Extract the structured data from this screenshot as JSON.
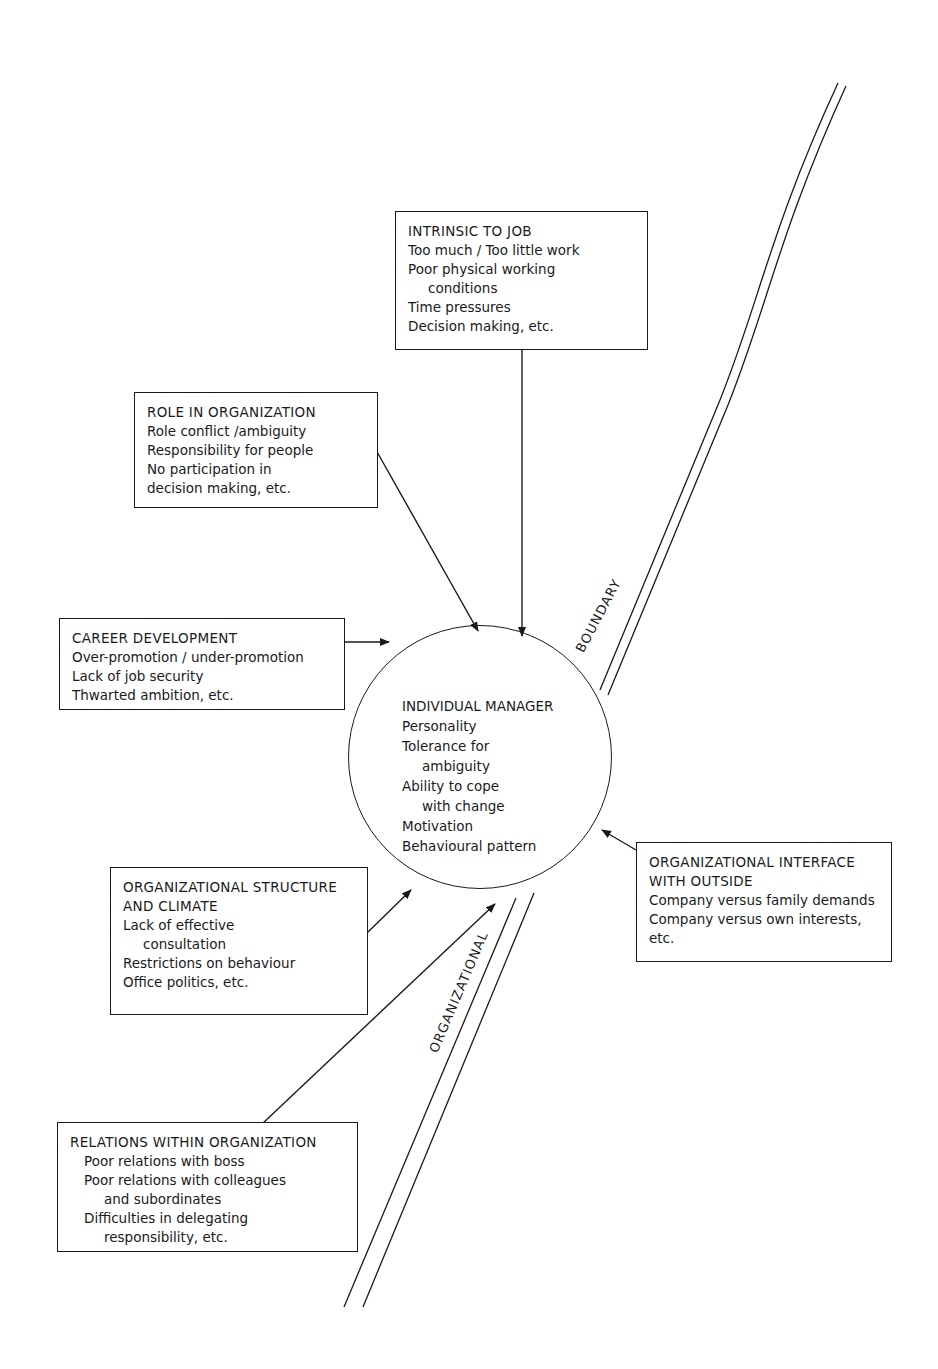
{
  "diagram": {
    "center": {
      "title": "INDIVIDUAL MANAGER",
      "items": [
        "Personality",
        "Tolerance for",
        "ambiguity",
        "Ability to cope",
        "with change",
        "Motivation",
        "Behavioural pattern"
      ]
    },
    "boxes": {
      "intrinsic": {
        "title": "INTRINSIC TO JOB",
        "items": [
          "Too much / Too little work",
          "Poor physical working",
          "conditions",
          "Time pressures",
          "Decision making, etc."
        ]
      },
      "role": {
        "title": "ROLE IN ORGANIZATION",
        "items": [
          "Role conflict /ambiguity",
          "Responsibility for people",
          "No participation in",
          "decision making, etc."
        ]
      },
      "career": {
        "title": "CAREER DEVELOPMENT",
        "items": [
          "Over-promotion / under-promotion",
          "Lack of job security",
          "Thwarted ambition, etc."
        ]
      },
      "structure": {
        "title_line1": "ORGANIZATIONAL STRUCTURE",
        "title_line2": "AND CLIMATE",
        "items": [
          "Lack of effective",
          "consultation",
          "Restrictions on behaviour",
          "Office politics, etc."
        ]
      },
      "interface": {
        "title_line1": "ORGANIZATIONAL INTERFACE",
        "title_line2": "WITH OUTSIDE",
        "items": [
          "Company versus family demands",
          "Company versus own interests,",
          "etc."
        ]
      },
      "relations": {
        "title": "RELATIONS WITHIN ORGANIZATION",
        "items": [
          "Poor relations with boss",
          "Poor relations with colleagues",
          "and subordinates",
          "Difficulties in delegating",
          "responsibility, etc."
        ]
      }
    },
    "boundary_labels": {
      "upper": "BOUNDARY",
      "lower": "ORGANIZATIONAL"
    }
  }
}
